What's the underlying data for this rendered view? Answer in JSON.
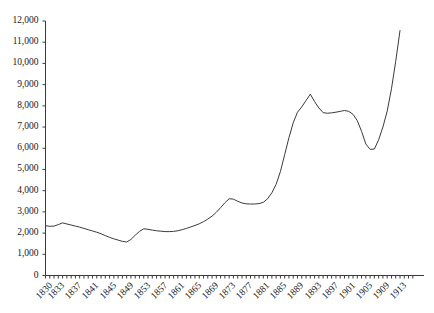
{
  "chart_data": {
    "type": "line",
    "title": "",
    "subtitle": "",
    "xlabel": "",
    "ylabel": "",
    "grid": false,
    "legend": null,
    "legend_position": "none",
    "series_color": "#3b3b3b",
    "xlim": [
      1830,
      1917
    ],
    "ylim": [
      0,
      12000
    ],
    "y_tick_labels": [
      "12,000",
      "11,000",
      "10,000",
      "9,000",
      "8,000",
      "7,000",
      "6,000",
      "5,000",
      "4,000",
      "3,000",
      "2,000",
      "1,000",
      "0"
    ],
    "y_tick_values": [
      12000,
      11000,
      10000,
      9000,
      8000,
      7000,
      6000,
      5000,
      4000,
      3000,
      2000,
      1000,
      0
    ],
    "x_tick_labels": [
      "1830",
      "1833",
      "1837",
      "1841",
      "1845",
      "1849",
      "1853",
      "1857",
      "1861",
      "1865",
      "1869",
      "1873",
      "1877",
      "1881",
      "1885",
      "1889",
      "1893",
      "1897",
      "1901",
      "1905",
      "1909",
      "1913"
    ],
    "x_tick_values": [
      1830,
      1833,
      1837,
      1841,
      1845,
      1849,
      1853,
      1857,
      1861,
      1865,
      1869,
      1873,
      1877,
      1881,
      1885,
      1889,
      1893,
      1897,
      1901,
      1905,
      1909,
      1913
    ],
    "x_minor_tick_step": 1,
    "series": [
      {
        "name": "series-1",
        "x": [
          1830,
          1831,
          1832,
          1833,
          1834,
          1835,
          1836,
          1837,
          1838,
          1839,
          1840,
          1841,
          1842,
          1843,
          1844,
          1845,
          1846,
          1847,
          1848,
          1849,
          1850,
          1851,
          1852,
          1853,
          1854,
          1855,
          1856,
          1857,
          1858,
          1859,
          1860,
          1861,
          1862,
          1863,
          1864,
          1865,
          1866,
          1867,
          1868,
          1869,
          1870,
          1871,
          1872,
          1873,
          1874,
          1875,
          1876,
          1877,
          1878,
          1879,
          1880,
          1881,
          1882,
          1883,
          1884,
          1885,
          1886,
          1887,
          1888,
          1889,
          1890,
          1891,
          1892,
          1893,
          1894,
          1895,
          1896,
          1897,
          1898,
          1899,
          1900,
          1901,
          1902,
          1903,
          1904,
          1905,
          1906,
          1907,
          1908,
          1909,
          1910,
          1911,
          1912,
          1913
        ],
        "values": [
          2350,
          2320,
          2330,
          2400,
          2480,
          2430,
          2380,
          2330,
          2280,
          2220,
          2160,
          2100,
          2040,
          1970,
          1880,
          1800,
          1730,
          1670,
          1610,
          1580,
          1700,
          1900,
          2080,
          2200,
          2180,
          2140,
          2110,
          2090,
          2070,
          2070,
          2080,
          2110,
          2160,
          2220,
          2290,
          2360,
          2440,
          2540,
          2660,
          2800,
          2980,
          3200,
          3430,
          3620,
          3600,
          3500,
          3420,
          3380,
          3370,
          3370,
          3390,
          3450,
          3620,
          3900,
          4300,
          4900,
          5700,
          6500,
          7200,
          7700,
          7950,
          8250,
          8550,
          8200,
          7900,
          7680,
          7650,
          7670,
          7700,
          7740,
          7780,
          7740,
          7600,
          7300,
          6800,
          6200,
          5950,
          5960,
          6400,
          7000,
          7750,
          8800,
          10100,
          11550
        ]
      }
    ]
  }
}
